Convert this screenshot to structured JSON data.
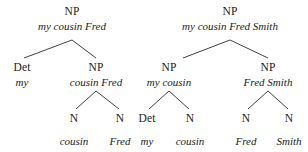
{
  "figure": {
    "kind": "syntax-tree-pair",
    "line_color": "#2a2a2a",
    "text_color": "#1a1a1a",
    "background": "#ffffff"
  },
  "trees": [
    {
      "id": "tree-left",
      "sentence": "my cousin Fred",
      "nodes": [
        {
          "id": "L0",
          "label": "NP",
          "phrase": "my cousin Fred",
          "x": 72,
          "label_y": 6,
          "phrase_y": 21
        },
        {
          "id": "L1",
          "label": "Det",
          "phrase": "my",
          "x": 22,
          "label_y": 62,
          "phrase_y": 77
        },
        {
          "id": "L2",
          "label": "NP",
          "phrase": "cousin Fred",
          "x": 96,
          "label_y": 62,
          "phrase_y": 77
        },
        {
          "id": "L3",
          "label": "N",
          "phrase": "cousin",
          "x": 74,
          "label_y": 113,
          "phrase_y": 136
        },
        {
          "id": "L4",
          "label": "N",
          "phrase": "Fred",
          "x": 120,
          "label_y": 113,
          "phrase_y": 136
        }
      ],
      "edges": [
        {
          "from": "L0",
          "to": "L1",
          "x1": 72,
          "y1": 40,
          "x2": 24,
          "y2": 58
        },
        {
          "from": "L0",
          "to": "L2",
          "x1": 72,
          "y1": 40,
          "x2": 96,
          "y2": 58
        },
        {
          "from": "L2",
          "to": "L3",
          "x1": 96,
          "y1": 91,
          "x2": 76,
          "y2": 109
        },
        {
          "from": "L2",
          "to": "L4",
          "x1": 96,
          "y1": 91,
          "x2": 119,
          "y2": 109
        }
      ]
    },
    {
      "id": "tree-right",
      "sentence": "my cousin Fred Smith",
      "nodes": [
        {
          "id": "R0",
          "label": "NP",
          "phrase": "my cousin Fred Smith",
          "x": 230,
          "label_y": 6,
          "phrase_y": 21
        },
        {
          "id": "R1",
          "label": "NP",
          "phrase": "my cousin",
          "x": 169,
          "label_y": 62,
          "phrase_y": 77
        },
        {
          "id": "R2",
          "label": "NP",
          "phrase": "Fred Smith",
          "x": 268,
          "label_y": 62,
          "phrase_y": 77
        },
        {
          "id": "R3",
          "label": "Det",
          "phrase": "my",
          "x": 147,
          "label_y": 113,
          "phrase_y": 136
        },
        {
          "id": "R4",
          "label": "N",
          "phrase": "cousin",
          "x": 190,
          "label_y": 113,
          "phrase_y": 136
        },
        {
          "id": "R5",
          "label": "N",
          "phrase": "Fred",
          "x": 246,
          "label_y": 113,
          "phrase_y": 136
        },
        {
          "id": "R6",
          "label": "N",
          "phrase": "Smith",
          "x": 289,
          "label_y": 113,
          "phrase_y": 136
        }
      ],
      "edges": [
        {
          "from": "R0",
          "to": "R1",
          "x1": 230,
          "y1": 40,
          "x2": 183,
          "y2": 58
        },
        {
          "from": "R0",
          "to": "R2",
          "x1": 230,
          "y1": 40,
          "x2": 268,
          "y2": 58
        },
        {
          "from": "R1",
          "to": "R3",
          "x1": 169,
          "y1": 91,
          "x2": 149,
          "y2": 109
        },
        {
          "from": "R1",
          "to": "R4",
          "x1": 169,
          "y1": 91,
          "x2": 189,
          "y2": 109
        },
        {
          "from": "R2",
          "to": "R5",
          "x1": 268,
          "y1": 91,
          "x2": 248,
          "y2": 109
        },
        {
          "from": "R2",
          "to": "R6",
          "x1": 268,
          "y1": 91,
          "x2": 288,
          "y2": 109
        }
      ]
    }
  ]
}
